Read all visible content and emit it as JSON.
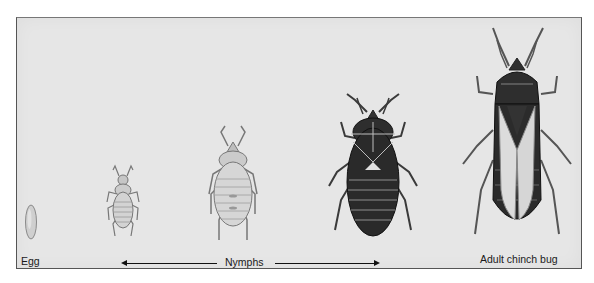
{
  "figure": {
    "stages": [
      {
        "id": "egg",
        "label": "Egg"
      },
      {
        "id": "nymph-1",
        "label": ""
      },
      {
        "id": "nymph-2",
        "label": ""
      },
      {
        "id": "nymph-3",
        "label": ""
      },
      {
        "id": "adult",
        "label": "Adult chinch bug"
      }
    ],
    "nymphs_label": "Nymphs",
    "colors": {
      "background": "#e6e6e6",
      "frame": "#555555",
      "dark_body": "#2a2a2a",
      "light_body": "#d0d0d0",
      "wing": "#dcdcdc"
    }
  }
}
